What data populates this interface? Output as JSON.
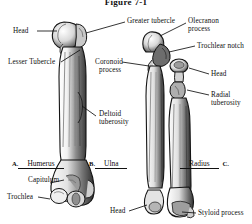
{
  "figure": {
    "title": "Figure 7-1",
    "background": "#ffffff",
    "ink": "#111111"
  },
  "bone_row": [
    {
      "marker": "A.",
      "name": "Humerus",
      "marker_side": "left"
    },
    {
      "marker": "B.",
      "name": "Ulna",
      "marker_side": "left"
    },
    {
      "marker": "C.",
      "name": "Radius",
      "marker_side": "right"
    }
  ],
  "labels": {
    "head_proximal_humerus": "Head",
    "greater_tubercle": "Greater tubercle",
    "lesser_tubercle": "Lesser Tubercle",
    "deltoid_tuberosity_l1": "Deltoid",
    "deltoid_tuberosity_l2": "tuberosity",
    "capitulum": "Capitulum",
    "trochlea": "Trochlea",
    "olecranon_l1": "Olecranon",
    "olecranon_l2": "process",
    "trochlear_notch": "Trochlear notch",
    "coronoid_l1": "Coronoid",
    "coronoid_l2": "process",
    "head_radius": "Head",
    "radial_tuberosity_l1": "Radial",
    "radial_tuberosity_l2": "tuberosity",
    "head_distal_ulna": "Head",
    "styloid_process": "Styloid process"
  }
}
